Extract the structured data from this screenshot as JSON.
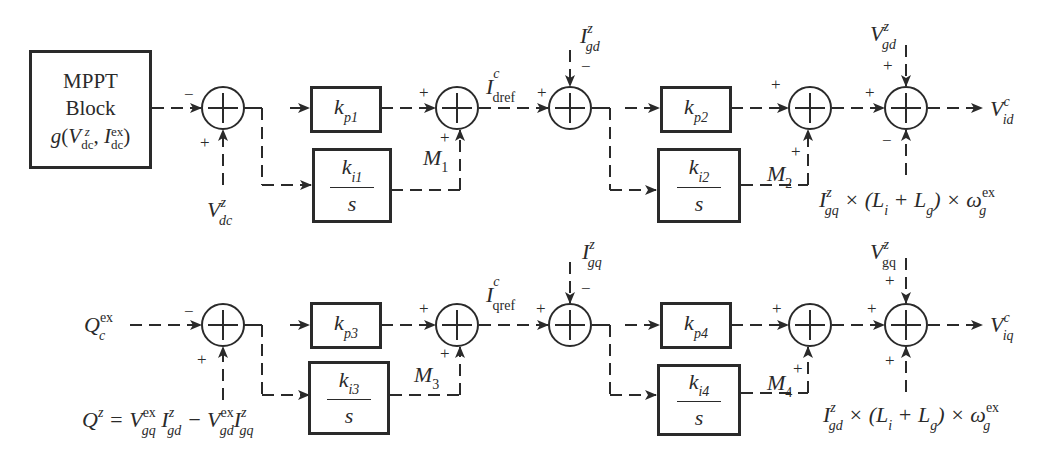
{
  "diagram": {
    "title": "",
    "type": "control block diagram",
    "d_axis": {
      "mppt_block": {
        "line1": "MPPT",
        "line2": "Block",
        "func": "g",
        "arg1": "V",
        "arg1_sup": "z",
        "arg1_sub": "dc",
        "arg2": "I",
        "arg2_sup": "ex",
        "arg2_sub": "dc"
      },
      "sum1": {
        "input_left_sign": "−",
        "input_bottom_sign": "+",
        "bottom_input": {
          "sym": "V",
          "sup": "z",
          "sub": "dc"
        }
      },
      "kp1": {
        "k": "k",
        "sub": "p1"
      },
      "ki1": {
        "k": "k",
        "sub": "i1",
        "den": "s"
      },
      "sum2": {
        "left_sign": "+",
        "bottom_sign": "+",
        "m_label": "M",
        "m_sub": "1"
      },
      "iref": {
        "sym": "I",
        "sup": "c",
        "sub": "dref"
      },
      "sum3": {
        "left_sign": "+",
        "top_sign": "−",
        "top_input": {
          "sym": "I",
          "sup": "z",
          "sub": "gd"
        }
      },
      "kp2": {
        "k": "k",
        "sub": "p2"
      },
      "ki2": {
        "k": "k",
        "sub": "i2",
        "den": "s"
      },
      "sum4": {
        "left_sign": "+",
        "bottom_sign": "+",
        "m_label": "M",
        "m_sub": "2"
      },
      "sum5": {
        "left_sign": "+",
        "top_sign": "+",
        "bottom_sign": "−",
        "top_input": {
          "sym": "V",
          "sup": "z",
          "sub": "gd"
        },
        "bottom_input": {
          "a": "I",
          "a_sup": "z",
          "a_sub": "gq",
          "mid": " × (L",
          "li_sub": "i",
          "plus": " + L",
          "lg_sub": "g",
          "end": ") × ω",
          "w_sup": "ex",
          "w_sub": "g"
        }
      },
      "output": {
        "sym": "V",
        "sup": "c",
        "sub": "id"
      }
    },
    "q_axis": {
      "input": {
        "sym": "Q",
        "sup": "ex",
        "sub": "c"
      },
      "sum1": {
        "input_left_sign": "−",
        "input_bottom_sign": "+",
        "bottom_input": {
          "lhs": "Q",
          "lhs_sup": "z",
          "eq": " = V",
          "v1_sup": "ex",
          "v1_sub": "gq",
          "i1": " I",
          "i1_sup": "z",
          "i1_sub": "gd",
          "minus": " − V",
          "v2_sup": "ex",
          "v2_sub": "gd",
          "i2": "I",
          "i2_sup": "z",
          "i2_sub": "gq"
        }
      },
      "kp3": {
        "k": "k",
        "sub": "p3"
      },
      "ki3": {
        "k": "k",
        "sub": "i3",
        "den": "s"
      },
      "sum2": {
        "left_sign": "+",
        "bottom_sign": "+",
        "m_label": "M",
        "m_sub": "3"
      },
      "iref": {
        "sym": "I",
        "sup": "c",
        "sub": "qref"
      },
      "sum3": {
        "left_sign": "+",
        "top_sign": "−",
        "top_input": {
          "sym": "I",
          "sup": "z",
          "sub": "gq"
        }
      },
      "kp4": {
        "k": "k",
        "sub": "p4"
      },
      "ki4": {
        "k": "k",
        "sub": "i4",
        "den": "s"
      },
      "sum4": {
        "left_sign": "+",
        "bottom_sign": "+",
        "m_label": "M",
        "m_sub": "4"
      },
      "sum5": {
        "left_sign": "+",
        "top_sign": "+",
        "bottom_sign": "+",
        "top_input": {
          "sym": "V",
          "sup": "z",
          "sub": "gq"
        },
        "bottom_input": {
          "a": "I",
          "a_sup": "z",
          "a_sub": "gd",
          "mid": " × (L",
          "li_sub": "i",
          "plus": " + L",
          "lg_sub": "g",
          "end": ") × ω",
          "w_sup": "ex",
          "w_sub": "g"
        }
      },
      "output": {
        "sym": "V",
        "sup": "c",
        "sub": "iq"
      }
    },
    "colors": {
      "ink": "#2a2a2a",
      "background": "#ffffff"
    }
  }
}
